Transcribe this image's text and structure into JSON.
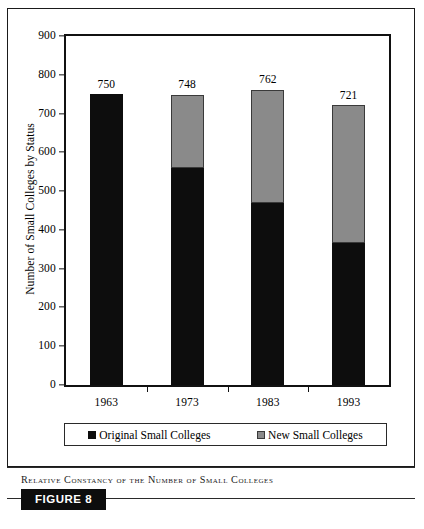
{
  "figure": {
    "caption": "Relative Constancy of the Number of Small Colleges",
    "tag": "FIGURE 8"
  },
  "chart_data": {
    "type": "bar",
    "subtype": "stacked-bar",
    "title": "",
    "xlabel": "",
    "ylabel": "Number of Small Colleges by Status",
    "categories": [
      "1963",
      "1973",
      "1983",
      "1993"
    ],
    "ylim": [
      0,
      900
    ],
    "yticks": [
      0,
      100,
      200,
      300,
      400,
      500,
      600,
      700,
      800,
      900
    ],
    "ytick_labels": [
      "0",
      "100",
      "200",
      "300",
      "400",
      "500",
      "600",
      "700",
      "800",
      "900"
    ],
    "grid": false,
    "legend_position": "bottom",
    "series": [
      {
        "name": "Original Small Colleges",
        "color": "#0d0d0d",
        "values": [
          750,
          560,
          470,
          365
        ]
      },
      {
        "name": "New Small Colleges",
        "color": "#8a8a8a",
        "values": [
          0,
          188,
          292,
          356
        ]
      }
    ],
    "totals": [
      750,
      748,
      762,
      721
    ],
    "total_labels": [
      "750",
      "748",
      "762",
      "721"
    ]
  }
}
